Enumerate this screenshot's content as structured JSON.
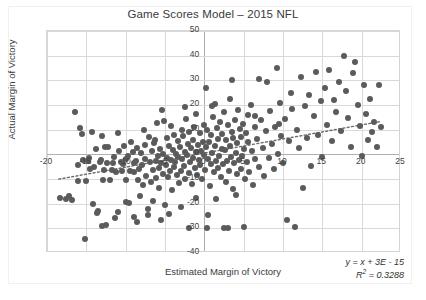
{
  "chart_data": {
    "type": "scatter",
    "title": "Game Scores Model – 2015 NFL",
    "xlabel": "Estimated Margin of Victory",
    "ylabel": "Actual Margin of Victory",
    "xlim": [
      -20,
      25
    ],
    "ylim": [
      -40,
      50
    ],
    "xticks": [
      -20,
      -15,
      -10,
      -5,
      0,
      5,
      10,
      15,
      20,
      25
    ],
    "xtick_labels": [
      "-20",
      "-15",
      "-10",
      "-5",
      "0",
      "5",
      "10",
      "15",
      "20",
      "25"
    ],
    "yticks": [
      -40,
      -30,
      -20,
      -10,
      0,
      10,
      20,
      30,
      40,
      50
    ],
    "ytick_labels": [
      "-40",
      "-30",
      "-20",
      "-10",
      "0",
      "10",
      "20",
      "30",
      "40",
      "50"
    ],
    "grid": true,
    "legend": "none",
    "point_color": "#5b5b5b",
    "gridline_color": "#d9d9d9",
    "trendline": {
      "style": "dotted",
      "color": "#6b6b6b",
      "equation": "y = x + 3E - 15",
      "r_squared": 0.3288,
      "slope": 0.5733,
      "intercept": 0.0,
      "x_start": -18.5,
      "x_end": 22.5
    },
    "annotations": {
      "equation_label": "y = x + 3E - 15",
      "r2_label_prefix": "R",
      "r2_label_sup": "2",
      "r2_label_value": "= 0.3288"
    },
    "n_points": 267,
    "points": [
      [
        -18.4,
        -17.5
      ],
      [
        -17.6,
        -18.2
      ],
      [
        -17.2,
        -16.9
      ],
      [
        -16.8,
        -18.6
      ],
      [
        -16.4,
        17.3
      ],
      [
        -16.1,
        -11.0
      ],
      [
        -15.8,
        10.5
      ],
      [
        -15.6,
        8.2
      ],
      [
        -15.4,
        -2.1
      ],
      [
        -15.2,
        -34.4
      ],
      [
        -15.0,
        -10.8
      ],
      [
        -14.8,
        -2.8
      ],
      [
        -14.6,
        -1.4
      ],
      [
        -14.5,
        -6.0
      ],
      [
        -14.2,
        -20.2
      ],
      [
        -14.0,
        -5.1
      ],
      [
        -13.8,
        2.0
      ],
      [
        -13.6,
        -23.8
      ],
      [
        -13.5,
        -23.1
      ],
      [
        -13.3,
        -3.0
      ],
      [
        -13.1,
        -2.2
      ],
      [
        -12.9,
        -10.5
      ],
      [
        -12.7,
        -6.4
      ],
      [
        -12.6,
        2.9
      ],
      [
        -12.4,
        -3.7
      ],
      [
        -12.2,
        3.0
      ],
      [
        -12.0,
        -10.6
      ],
      [
        -11.8,
        -6.5
      ],
      [
        -11.6,
        -3.6
      ],
      [
        -11.5,
        -1.0
      ],
      [
        -11.3,
        -26.0
      ],
      [
        -11.2,
        -7.0
      ],
      [
        -11.0,
        -23.5
      ],
      [
        -10.8,
        1.5
      ],
      [
        -10.6,
        -3.2
      ],
      [
        -10.5,
        -6.9
      ],
      [
        -10.3,
        -4.0
      ],
      [
        -10.2,
        3.5
      ],
      [
        -10.0,
        -2.0
      ],
      [
        -9.9,
        -10.4
      ],
      [
        -9.7,
        -0.5
      ],
      [
        -9.6,
        -19.6
      ],
      [
        -9.4,
        -6.7
      ],
      [
        -9.3,
        5.0
      ],
      [
        -9.1,
        1.0
      ],
      [
        -9.0,
        -3.5
      ],
      [
        -8.9,
        -7.3
      ],
      [
        -8.7,
        -2.5
      ],
      [
        -8.6,
        2.4
      ],
      [
        -8.4,
        -10.3
      ],
      [
        -8.3,
        -6.0
      ],
      [
        -8.2,
        -17.0
      ],
      [
        -8.0,
        0.5
      ],
      [
        -7.9,
        -4.5
      ],
      [
        -7.8,
        -12.5
      ],
      [
        -7.6,
        3.8
      ],
      [
        -7.5,
        -1.8
      ],
      [
        -7.4,
        -8.8
      ],
      [
        -7.2,
        -22.0
      ],
      [
        -7.1,
        -24.5
      ],
      [
        -7.0,
        7.0
      ],
      [
        -6.9,
        -3.0
      ],
      [
        -6.8,
        -11.4
      ],
      [
        -6.6,
        1.2
      ],
      [
        -6.5,
        -6.2
      ],
      [
        -6.4,
        4.5
      ],
      [
        -6.2,
        -2.7
      ],
      [
        -6.1,
        -9.5
      ],
      [
        -6.0,
        12.8
      ],
      [
        -5.9,
        -0.8
      ],
      [
        -5.8,
        -5.5
      ],
      [
        -5.7,
        -13.5
      ],
      [
        -5.6,
        2.2
      ],
      [
        -5.5,
        -3.4
      ],
      [
        -5.4,
        17.8
      ],
      [
        -5.3,
        -7.8
      ],
      [
        -5.2,
        0.2
      ],
      [
        -5.1,
        13.5
      ],
      [
        -5.0,
        -20.5
      ],
      [
        -4.9,
        -4.2
      ],
      [
        -4.8,
        6.5
      ],
      [
        -4.7,
        -1.5
      ],
      [
        -4.6,
        -9.0
      ],
      [
        -4.5,
        3.2
      ],
      [
        -4.4,
        -6.6
      ],
      [
        -4.3,
        11.5
      ],
      [
        -4.2,
        -2.4
      ],
      [
        -4.1,
        -14.5
      ],
      [
        -4.0,
        1.8
      ],
      [
        -3.9,
        -5.0
      ],
      [
        -3.8,
        8.0
      ],
      [
        -3.7,
        -3.3
      ],
      [
        -3.6,
        0.0
      ],
      [
        -3.5,
        -8.2
      ],
      [
        -3.4,
        5.5
      ],
      [
        -3.3,
        -1.2
      ],
      [
        -3.2,
        -11.8
      ],
      [
        -3.1,
        3.0
      ],
      [
        -3.0,
        -6.8
      ],
      [
        -2.9,
        10.0
      ],
      [
        -2.8,
        -2.0
      ],
      [
        -2.7,
        7.4
      ],
      [
        -2.6,
        -4.8
      ],
      [
        -2.5,
        1.0
      ],
      [
        -2.4,
        -9.8
      ],
      [
        -2.3,
        14.5
      ],
      [
        -2.2,
        -0.4
      ],
      [
        -2.1,
        4.0
      ],
      [
        -2.0,
        -7.5
      ],
      [
        -1.9,
        9.2
      ],
      [
        -1.8,
        -3.0
      ],
      [
        -1.7,
        2.6
      ],
      [
        -1.6,
        -12.0
      ],
      [
        -1.5,
        6.0
      ],
      [
        -1.4,
        -1.6
      ],
      [
        -1.3,
        11.0
      ],
      [
        -1.2,
        -5.6
      ],
      [
        -1.1,
        0.8
      ],
      [
        -1.0,
        16.5
      ],
      [
        -0.9,
        -8.5
      ],
      [
        -0.8,
        3.6
      ],
      [
        -0.7,
        -2.2
      ],
      [
        -0.6,
        8.6
      ],
      [
        -0.5,
        -4.4
      ],
      [
        -0.4,
        1.4
      ],
      [
        -0.3,
        -10.0
      ],
      [
        -0.2,
        5.2
      ],
      [
        -0.1,
        -0.2
      ],
      [
        0.0,
        12.0
      ],
      [
        0.1,
        -6.2
      ],
      [
        0.2,
        2.8
      ],
      [
        0.3,
        -29.8
      ],
      [
        0.4,
        9.8
      ],
      [
        0.5,
        -1.8
      ],
      [
        0.6,
        4.8
      ],
      [
        0.7,
        -13.0
      ],
      [
        0.8,
        7.8
      ],
      [
        0.9,
        -3.8
      ],
      [
        1.0,
        0.4
      ],
      [
        1.1,
        15.0
      ],
      [
        1.2,
        -7.2
      ],
      [
        1.3,
        3.4
      ],
      [
        1.4,
        20.5
      ],
      [
        1.5,
        -2.6
      ],
      [
        1.6,
        10.8
      ],
      [
        1.7,
        -5.4
      ],
      [
        1.8,
        6.2
      ],
      [
        1.9,
        -0.6
      ],
      [
        2.0,
        13.0
      ],
      [
        2.1,
        -9.2
      ],
      [
        2.2,
        2.0
      ],
      [
        2.3,
        8.4
      ],
      [
        2.4,
        -4.0
      ],
      [
        2.5,
        17.0
      ],
      [
        2.6,
        1.6
      ],
      [
        2.7,
        -11.2
      ],
      [
        2.8,
        5.8
      ],
      [
        2.9,
        -2.8
      ],
      [
        3.0,
        11.8
      ],
      [
        3.1,
        -6.8
      ],
      [
        3.2,
        3.2
      ],
      [
        3.3,
        22.5
      ],
      [
        3.4,
        -1.0
      ],
      [
        3.5,
        9.0
      ],
      [
        3.6,
        -14.0
      ],
      [
        3.7,
        6.8
      ],
      [
        3.8,
        -3.6
      ],
      [
        3.9,
        14.0
      ],
      [
        4.0,
        0.6
      ],
      [
        4.1,
        -8.0
      ],
      [
        4.2,
        4.4
      ],
      [
        4.3,
        18.0
      ],
      [
        4.4,
        -2.4
      ],
      [
        4.5,
        10.2
      ],
      [
        4.6,
        -5.8
      ],
      [
        4.7,
        7.2
      ],
      [
        4.8,
        -0.8
      ],
      [
        4.9,
        12.5
      ],
      [
        5.0,
        -29.5
      ],
      [
        5.1,
        2.2
      ],
      [
        5.2,
        -10.2
      ],
      [
        5.3,
        8.8
      ],
      [
        5.4,
        -3.2
      ],
      [
        5.5,
        16.0
      ],
      [
        5.6,
        5.0
      ],
      [
        5.7,
        -7.0
      ],
      [
        5.9,
        20.0
      ],
      [
        6.0,
        1.2
      ],
      [
        6.2,
        -12.5
      ],
      [
        6.4,
        11.0
      ],
      [
        6.5,
        -2.0
      ],
      [
        6.7,
        6.4
      ],
      [
        6.9,
        30.5
      ],
      [
        7.0,
        -5.2
      ],
      [
        7.2,
        13.8
      ],
      [
        7.4,
        2.6
      ],
      [
        7.6,
        -8.6
      ],
      [
        7.8,
        9.4
      ],
      [
        8.0,
        29.5
      ],
      [
        8.2,
        -1.4
      ],
      [
        8.4,
        17.5
      ],
      [
        8.6,
        4.2
      ],
      [
        8.8,
        -6.0
      ],
      [
        9.0,
        11.2
      ],
      [
        9.2,
        35.0
      ],
      [
        9.4,
        0.2
      ],
      [
        9.6,
        21.0
      ],
      [
        9.8,
        7.6
      ],
      [
        10.0,
        -3.4
      ],
      [
        10.2,
        14.2
      ],
      [
        10.5,
        -26.5
      ],
      [
        10.8,
        5.6
      ],
      [
        11.0,
        25.0
      ],
      [
        11.2,
        18.5
      ],
      [
        11.5,
        -29.5
      ],
      [
        11.8,
        10.0
      ],
      [
        12.0,
        2.4
      ],
      [
        12.3,
        31.5
      ],
      [
        12.5,
        -13.5
      ],
      [
        12.8,
        19.5
      ],
      [
        13.0,
        6.6
      ],
      [
        13.3,
        24.0
      ],
      [
        13.6,
        -4.6
      ],
      [
        13.9,
        15.5
      ],
      [
        14.2,
        33.5
      ],
      [
        14.5,
        8.0
      ],
      [
        14.8,
        21.5
      ],
      [
        15.0,
        -1.2
      ],
      [
        15.3,
        27.0
      ],
      [
        15.6,
        12.0
      ],
      [
        15.9,
        34.0
      ],
      [
        16.2,
        5.4
      ],
      [
        16.5,
        22.0
      ],
      [
        16.8,
        17.0
      ],
      [
        17.1,
        29.5
      ],
      [
        17.4,
        9.6
      ],
      [
        17.7,
        40.0
      ],
      [
        18.0,
        25.5
      ],
      [
        18.3,
        14.8
      ],
      [
        18.6,
        2.8
      ],
      [
        18.9,
        33.0
      ],
      [
        19.2,
        37.5
      ],
      [
        19.5,
        20.0
      ],
      [
        19.8,
        11.5
      ],
      [
        20.0,
        -0.5
      ],
      [
        20.3,
        28.0
      ],
      [
        20.5,
        16.5
      ],
      [
        20.8,
        6.0
      ],
      [
        21.0,
        22.5
      ],
      [
        21.3,
        9.0
      ],
      [
        21.6,
        13.0
      ],
      [
        21.9,
        3.0
      ],
      [
        22.2,
        28.0
      ],
      [
        22.5,
        11.0
      ],
      [
        -13.0,
        -29.0
      ],
      [
        -12.5,
        -28.5
      ],
      [
        -10.0,
        -19.5
      ],
      [
        -9.0,
        -25.5
      ],
      [
        -8.5,
        -27.5
      ],
      [
        -6.5,
        -19.0
      ],
      [
        -5.5,
        -26.5
      ],
      [
        -4.5,
        -24.0
      ],
      [
        -3.0,
        -21.5
      ],
      [
        -2.0,
        -30.0
      ],
      [
        -1.0,
        -17.5
      ],
      [
        0.5,
        -24.5
      ],
      [
        1.5,
        -18.0
      ],
      [
        2.5,
        -30.0
      ],
      [
        3.0,
        -29.8
      ],
      [
        4.0,
        -16.5
      ],
      [
        -16.0,
        -4.5
      ],
      [
        -14.3,
        9.0
      ],
      [
        -13.0,
        7.5
      ],
      [
        -11.0,
        8.5
      ],
      [
        -7.7,
        10.0
      ],
      [
        -6.3,
        6.0
      ],
      [
        -2.5,
        19.0
      ],
      [
        0.2,
        27.0
      ],
      [
        1.0,
        19.5
      ],
      [
        3.5,
        30.0
      ],
      [
        6.5,
        15.5
      ],
      [
        9.5,
        12.5
      ]
    ]
  }
}
